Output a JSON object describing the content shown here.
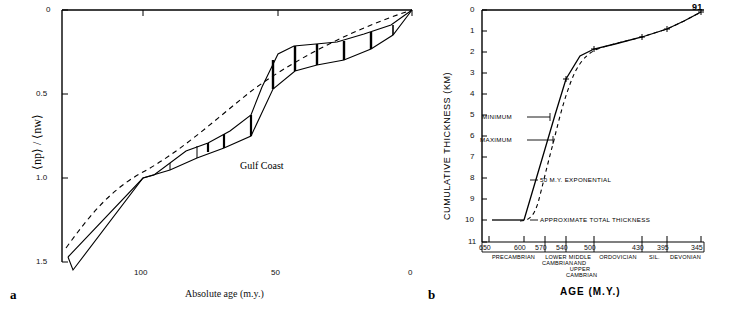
{
  "figure": {
    "panel_a_letter": "a",
    "panel_b_letter": "b"
  },
  "chart_data": [
    {
      "type": "line",
      "panel": "a",
      "title": "",
      "annotation": "Gulf Coast",
      "xlabel": "Absolute age (m.y.)",
      "ylabel": "⟨np⟩ / ⟨nw⟩",
      "xlim": [
        130,
        0
      ],
      "ylim": [
        1.6,
        0
      ],
      "xticks": [
        100,
        50,
        0
      ],
      "xticklabels": [
        "100",
        "50",
        "0"
      ],
      "yticks": [
        0,
        0.5,
        1.0,
        1.5
      ],
      "yticklabels": [
        "0",
        "0.5",
        "1.0",
        "1.5"
      ],
      "grid": false,
      "legend": "none",
      "series": [
        {
          "name": "upper envelope",
          "style": "solid",
          "x": [
            125,
            123,
            100,
            96,
            84,
            76,
            68,
            60,
            56,
            50,
            44,
            36,
            28,
            18,
            8,
            0
          ],
          "y": [
            1.47,
            1.55,
            1.0,
            0.98,
            0.84,
            0.79,
            0.72,
            0.62,
            0.46,
            0.26,
            0.21,
            0.2,
            0.19,
            0.14,
            0.09,
            0.0
          ]
        },
        {
          "name": "lower envelope",
          "style": "solid",
          "x": [
            125,
            100,
            90,
            80,
            70,
            60,
            52,
            44,
            36,
            28,
            18,
            8,
            0
          ],
          "y": [
            1.47,
            1.0,
            0.95,
            0.88,
            0.82,
            0.75,
            0.47,
            0.36,
            0.33,
            0.3,
            0.23,
            0.15,
            0.0
          ]
        },
        {
          "name": "exponential fit",
          "style": "dashed",
          "x": [
            128,
            120,
            110,
            100,
            90,
            80,
            70,
            60,
            50,
            40,
            30,
            20,
            10,
            0
          ],
          "y": [
            1.42,
            1.2,
            1.02,
            0.88,
            0.76,
            0.65,
            0.55,
            0.46,
            0.37,
            0.29,
            0.21,
            0.14,
            0.07,
            0.0
          ]
        }
      ]
    },
    {
      "type": "line",
      "panel": "b",
      "title": "",
      "xlabel": "AGE (M.Y.)",
      "ylabel": "CUMULATIVE THICKNESS (KM)",
      "xlim": [
        660,
        340
      ],
      "ylim": [
        11,
        0
      ],
      "xticks": [
        650,
        600,
        570,
        540,
        500,
        430,
        395,
        345
      ],
      "xticklabels": [
        "650",
        "600",
        "570",
        "540",
        "500",
        "430",
        "395",
        "345"
      ],
      "yticks": [
        0,
        1,
        2,
        3,
        4,
        5,
        6,
        7,
        8,
        9,
        10,
        11
      ],
      "yticklabels": [
        "0",
        "1",
        "2",
        "3",
        "4",
        "5",
        "6",
        "7",
        "8",
        "9",
        "10",
        "11"
      ],
      "grid": false,
      "annotations": [
        {
          "text": "MINIMUM",
          "x": 600,
          "y": 5.0
        },
        {
          "text": "MAXIMUM",
          "x": 600,
          "y": 6.5
        },
        {
          "text": "50 M.Y. EXPONENTIAL",
          "x": 600,
          "y": 8.4
        },
        {
          "text": "APPROXIMATE TOTAL THICKNESS",
          "x": 590,
          "y": 10.0
        },
        {
          "text": "91",
          "x": 348,
          "y": 0.15
        }
      ],
      "series": [
        {
          "name": "observed cumulative thickness",
          "style": "solid",
          "x": [
            600,
            570,
            555,
            540,
            520,
            500,
            470,
            430,
            395,
            370,
            345
          ],
          "y": [
            10.0,
            6.6,
            5.0,
            3.3,
            2.2,
            1.85,
            1.6,
            1.3,
            0.9,
            0.5,
            0.1
          ]
        },
        {
          "name": "50 m.y. exponential",
          "style": "dashed",
          "x": [
            615,
            600,
            585,
            570,
            555,
            540,
            520,
            500,
            470,
            430,
            395,
            370,
            345
          ],
          "y": [
            10.05,
            9.9,
            9.2,
            7.4,
            5.3,
            3.3,
            2.3,
            1.85,
            1.6,
            1.3,
            0.9,
            0.5,
            0.1
          ]
        }
      ],
      "markers": {
        "x": [
          540,
          500,
          430,
          395,
          345
        ],
        "y": [
          3.3,
          1.85,
          1.3,
          0.9,
          0.1
        ]
      },
      "period_bands": [
        {
          "label": "PRECAMBRIAN",
          "x_start": 660,
          "x_end": 570
        },
        {
          "label": "LOWER\nCAMBRIAN",
          "x_start": 570,
          "x_end": 540
        },
        {
          "label": "MIDDLE\nAND\nUPPER\nCAMBRIAN",
          "x_start": 540,
          "x_end": 500
        },
        {
          "label": "ORDOVICIAN",
          "x_start": 500,
          "x_end": 430
        },
        {
          "label": "SIL.",
          "x_start": 430,
          "x_end": 395
        },
        {
          "label": "DEVONIAN",
          "x_start": 395,
          "x_end": 345
        }
      ]
    }
  ]
}
